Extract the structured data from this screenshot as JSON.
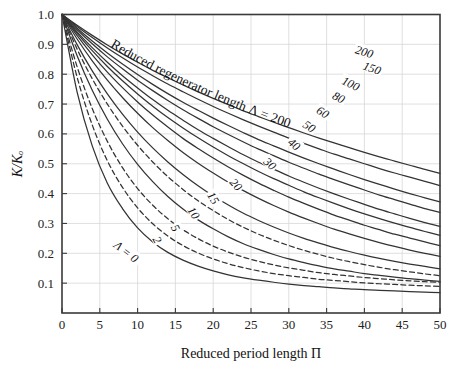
{
  "chart_data": {
    "type": "line",
    "title": "",
    "annotation": "Reduced regenerator length Λ = 200",
    "xlabel": "Reduced period length Π",
    "ylabel": "K/Kₒ",
    "xlim": [
      0,
      50
    ],
    "ylim": [
      0,
      1.0
    ],
    "grid": true,
    "legend_position": "inline-curve-labels",
    "xticks": [
      0,
      5,
      10,
      15,
      20,
      25,
      30,
      35,
      40,
      45,
      50
    ],
    "xtick_labels": [
      "0",
      "5",
      "10",
      "15",
      "20",
      "25",
      "30",
      "35",
      "40",
      "45",
      "50"
    ],
    "yticks": [
      0.1,
      0.2,
      0.3,
      0.4,
      0.5,
      0.6,
      0.7,
      0.8,
      0.9,
      1.0
    ],
    "ytick_labels": [
      "0.1",
      "0.2",
      "0.3",
      "0.4",
      "0.5",
      "0.6",
      "0.7",
      "0.8",
      "0.9",
      "1.0"
    ],
    "x": [
      0,
      2,
      4,
      6,
      8,
      10,
      12,
      14,
      16,
      18,
      20,
      22,
      24,
      26,
      28,
      30,
      32,
      34,
      36,
      38,
      40,
      42,
      44,
      46,
      48,
      50
    ],
    "series": [
      {
        "name": "Λ = 0",
        "label": "Λ = 0",
        "style": "solid",
        "label_x": 8.5,
        "label_y": 0.205,
        "label_rot": 38,
        "values": [
          1.0,
          0.74,
          0.56,
          0.435,
          0.35,
          0.285,
          0.238,
          0.203,
          0.177,
          0.157,
          0.141,
          0.128,
          0.118,
          0.11,
          0.103,
          0.097,
          0.092,
          0.088,
          0.084,
          0.081,
          0.078,
          0.076,
          0.074,
          0.072,
          0.07,
          0.068
        ]
      },
      {
        "name": "Λ = 2",
        "label": "2",
        "style": "dashed",
        "label_x": 12.6,
        "label_y": 0.245,
        "label_rot": 62,
        "values": [
          1.0,
          0.79,
          0.63,
          0.51,
          0.421,
          0.352,
          0.299,
          0.258,
          0.226,
          0.201,
          0.181,
          0.165,
          0.152,
          0.141,
          0.132,
          0.125,
          0.119,
          0.113,
          0.109,
          0.105,
          0.101,
          0.098,
          0.096,
          0.093,
          0.091,
          0.089
        ]
      },
      {
        "name": "Λ = 5",
        "label": "5",
        "style": "dashed",
        "label_x": 15.0,
        "label_y": 0.285,
        "label_rot": 62,
        "values": [
          1.0,
          0.825,
          0.685,
          0.575,
          0.487,
          0.417,
          0.361,
          0.316,
          0.279,
          0.249,
          0.224,
          0.204,
          0.187,
          0.173,
          0.161,
          0.151,
          0.143,
          0.135,
          0.129,
          0.124,
          0.119,
          0.115,
          0.111,
          0.108,
          0.105,
          0.103
        ]
      },
      {
        "name": "Λ = 10",
        "label": "10",
        "style": "solid",
        "label_x": 17.4,
        "label_y": 0.335,
        "label_rot": 58,
        "values": [
          1.0,
          0.862,
          0.746,
          0.649,
          0.567,
          0.498,
          0.44,
          0.39,
          0.348,
          0.312,
          0.282,
          0.255,
          0.232,
          0.213,
          0.196,
          0.181,
          0.169,
          0.158,
          0.148,
          0.14,
          0.132,
          0.126,
          0.12,
          0.115,
          0.11,
          0.106
        ]
      },
      {
        "name": "Λ = 15",
        "label": "15",
        "style": "dashed",
        "label_x": 20.0,
        "label_y": 0.385,
        "label_rot": 58,
        "values": [
          1.0,
          0.884,
          0.785,
          0.7,
          0.626,
          0.562,
          0.506,
          0.457,
          0.414,
          0.376,
          0.343,
          0.313,
          0.287,
          0.264,
          0.244,
          0.226,
          0.21,
          0.196,
          0.183,
          0.172,
          0.162,
          0.153,
          0.145,
          0.138,
          0.131,
          0.125
        ]
      },
      {
        "name": "Λ = 20",
        "label": "20",
        "style": "solid",
        "label_x": 23.0,
        "label_y": 0.43,
        "label_rot": 48,
        "values": [
          1.0,
          0.899,
          0.811,
          0.734,
          0.666,
          0.606,
          0.553,
          0.506,
          0.464,
          0.426,
          0.392,
          0.362,
          0.334,
          0.31,
          0.288,
          0.268,
          0.25,
          0.234,
          0.219,
          0.206,
          0.194,
          0.183,
          0.173,
          0.164,
          0.156,
          0.148
        ]
      },
      {
        "name": "Λ = 30",
        "label": "30",
        "style": "solid",
        "label_x": 27.5,
        "label_y": 0.5,
        "label_rot": 42,
        "values": [
          1.0,
          0.918,
          0.845,
          0.78,
          0.722,
          0.669,
          0.621,
          0.578,
          0.538,
          0.502,
          0.469,
          0.438,
          0.41,
          0.384,
          0.36,
          0.338,
          0.318,
          0.299,
          0.281,
          0.265,
          0.25,
          0.236,
          0.223,
          0.211,
          0.2,
          0.19
        ]
      },
      {
        "name": "Λ = 40",
        "label": "40",
        "style": "solid",
        "label_x": 30.7,
        "label_y": 0.565,
        "label_rot": 38,
        "values": [
          1.0,
          0.929,
          0.865,
          0.807,
          0.755,
          0.707,
          0.663,
          0.623,
          0.585,
          0.551,
          0.519,
          0.489,
          0.461,
          0.435,
          0.411,
          0.388,
          0.367,
          0.347,
          0.328,
          0.311,
          0.294,
          0.279,
          0.264,
          0.251,
          0.238,
          0.226
        ]
      },
      {
        "name": "Λ = 50",
        "label": "50",
        "style": "solid",
        "label_x": 32.7,
        "label_y": 0.625,
        "label_rot": 34,
        "values": [
          1.0,
          0.937,
          0.879,
          0.826,
          0.778,
          0.734,
          0.693,
          0.655,
          0.62,
          0.587,
          0.556,
          0.527,
          0.5,
          0.474,
          0.45,
          0.428,
          0.406,
          0.386,
          0.367,
          0.349,
          0.332,
          0.316,
          0.301,
          0.287,
          0.273,
          0.26
        ]
      },
      {
        "name": "Λ = 60",
        "label": "60",
        "style": "solid",
        "label_x": 34.5,
        "label_y": 0.672,
        "label_rot": 32,
        "values": [
          1.0,
          0.942,
          0.889,
          0.84,
          0.795,
          0.754,
          0.715,
          0.679,
          0.646,
          0.614,
          0.585,
          0.557,
          0.53,
          0.505,
          0.482,
          0.459,
          0.438,
          0.418,
          0.399,
          0.381,
          0.364,
          0.347,
          0.332,
          0.317,
          0.303,
          0.29
        ]
      },
      {
        "name": "Λ = 80",
        "label": "80",
        "style": "solid",
        "label_x": 36.6,
        "label_y": 0.722,
        "label_rot": 28,
        "values": [
          1.0,
          0.949,
          0.902,
          0.858,
          0.818,
          0.78,
          0.745,
          0.712,
          0.681,
          0.652,
          0.624,
          0.598,
          0.573,
          0.549,
          0.527,
          0.505,
          0.485,
          0.465,
          0.447,
          0.429,
          0.412,
          0.395,
          0.38,
          0.365,
          0.35,
          0.337
        ]
      },
      {
        "name": "Λ = 100",
        "label": "100",
        "style": "solid",
        "label_x": 38.2,
        "label_y": 0.768,
        "label_rot": 25,
        "values": [
          1.0,
          0.954,
          0.911,
          0.871,
          0.834,
          0.799,
          0.766,
          0.735,
          0.706,
          0.679,
          0.653,
          0.628,
          0.604,
          0.581,
          0.56,
          0.539,
          0.519,
          0.5,
          0.482,
          0.464,
          0.447,
          0.431,
          0.415,
          0.4,
          0.386,
          0.372
        ]
      },
      {
        "name": "Λ = 150",
        "label": "150",
        "style": "solid",
        "label_x": 41.0,
        "label_y": 0.82,
        "label_rot": 20,
        "values": [
          1.0,
          0.96,
          0.923,
          0.888,
          0.855,
          0.824,
          0.795,
          0.767,
          0.741,
          0.716,
          0.692,
          0.669,
          0.647,
          0.626,
          0.606,
          0.586,
          0.568,
          0.55,
          0.532,
          0.516,
          0.5,
          0.484,
          0.469,
          0.455,
          0.441,
          0.427
        ]
      },
      {
        "name": "Λ = 200",
        "label": "200",
        "style": "solid",
        "label_x": 40.0,
        "label_y": 0.875,
        "label_rot": 17,
        "values": [
          1.0,
          0.964,
          0.93,
          0.898,
          0.868,
          0.84,
          0.813,
          0.788,
          0.764,
          0.741,
          0.719,
          0.698,
          0.677,
          0.658,
          0.639,
          0.621,
          0.603,
          0.586,
          0.57,
          0.554,
          0.538,
          0.523,
          0.509,
          0.495,
          0.481,
          0.468
        ]
      }
    ],
    "annotation_path_series": "Λ = 200"
  },
  "axes": {
    "x_title": "Reduced period length Π",
    "y_title": "K/Kₒ",
    "line_color": "#333333",
    "grid_color": "#d8d8d8"
  }
}
